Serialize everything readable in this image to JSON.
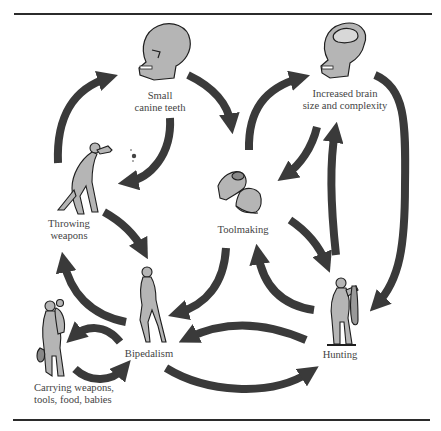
{
  "figure": {
    "type": "cyclic feedback diagram",
    "arrow_color": "#3a3a3a",
    "figure_fill": "#b5b5b5",
    "figure_stroke": "#1e1e1e",
    "text_color": "#444444"
  },
  "nodes": {
    "small_canine": {
      "label_line1": "Small",
      "label_line2": "canine teeth",
      "icon": "skull-icon"
    },
    "brain": {
      "label_line1": "Increased brain",
      "label_line2": "size and complexity",
      "icon": "skull-with-brain-icon"
    },
    "throwing": {
      "label_line1": "Throwing",
      "label_line2": "weapons",
      "icon": "throwing-hominid-icon"
    },
    "toolmaking": {
      "label": "Toolmaking",
      "icon": "hands-knapping-icon"
    },
    "bipedalism": {
      "label": "Bipedalism",
      "icon": "walking-hominid-icon"
    },
    "hunting": {
      "label": "Hunting",
      "icon": "hunter-with-prey-icon"
    },
    "carrying": {
      "label_line1": "Carrying weapons,",
      "label_line2": "tools, food, babies",
      "icon": "carrying-hominid-icon"
    }
  },
  "edges": [
    {
      "from": "Throwing weapons",
      "to": "Small canine teeth"
    },
    {
      "from": "Small canine teeth",
      "to": "Throwing weapons"
    },
    {
      "from": "Small canine teeth",
      "to": "Toolmaking"
    },
    {
      "from": "Toolmaking",
      "to": "Increased brain size and complexity"
    },
    {
      "from": "Increased brain size and complexity",
      "to": "Toolmaking"
    },
    {
      "from": "Hunting",
      "to": "Increased brain size and complexity"
    },
    {
      "from": "Increased brain size and complexity",
      "to": "Hunting"
    },
    {
      "from": "Throwing weapons",
      "to": "Bipedalism"
    },
    {
      "from": "Bipedalism",
      "to": "Throwing weapons"
    },
    {
      "from": "Toolmaking",
      "to": "Bipedalism"
    },
    {
      "from": "Toolmaking",
      "to": "Hunting"
    },
    {
      "from": "Hunting",
      "to": "Toolmaking"
    },
    {
      "from": "Hunting",
      "to": "Bipedalism"
    },
    {
      "from": "Bipedalism",
      "to": "Hunting"
    },
    {
      "from": "Bipedalism",
      "to": "Carrying weapons, tools, food, babies"
    },
    {
      "from": "Carrying weapons, tools, food, babies",
      "to": "Bipedalism"
    }
  ]
}
